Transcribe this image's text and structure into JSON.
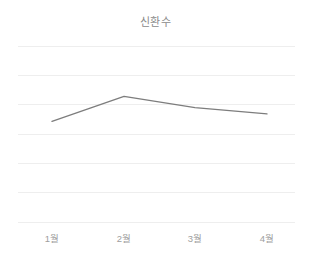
{
  "chart_data": {
    "type": "line",
    "title": "신환수",
    "xlabel": "",
    "ylabel": "",
    "categories": [
      "1월",
      "2월",
      "3월",
      "4월"
    ],
    "values": [
      4.0,
      5.0,
      4.55,
      4.3
    ],
    "series": [
      {
        "name": "신환수",
        "values": [
          4.0,
          5.0,
          4.55,
          4.3
        ]
      }
    ],
    "ylim": [
      0,
      7
    ],
    "grid": true,
    "gridline_count": 7,
    "legend": false,
    "legend_position": "none",
    "line_color": "#7d7d7d",
    "gridline_color": "#eeeeee",
    "background_color": "#ffffff",
    "title_color": "#8a8a8a",
    "tick_label_color": "#9e9e9e",
    "markers": false,
    "annotations": []
  },
  "plot_geometry": {
    "left": 18,
    "right": 295,
    "top": 46,
    "bottom": 222,
    "x_positions": [
      52,
      124,
      195,
      267
    ]
  }
}
